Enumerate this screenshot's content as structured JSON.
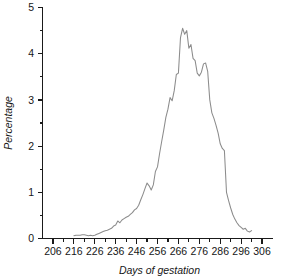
{
  "chart_data": {
    "type": "line",
    "title": "",
    "xlabel": "Days of gestation",
    "ylabel": "Percentage",
    "xlim": [
      201,
      311
    ],
    "ylim": [
      0,
      5
    ],
    "grid": false,
    "legend": "none",
    "line_color": "#8c8c8c",
    "axis_color": "#1a1a1a",
    "xticks": [
      206,
      216,
      226,
      236,
      246,
      256,
      266,
      276,
      286,
      296,
      306
    ],
    "xtick_labels": [
      "206",
      "216",
      "226",
      "236",
      "246",
      "256",
      "266",
      "276",
      "286",
      "296",
      "306"
    ],
    "xtick_minor_step": 5,
    "yticks": [
      0,
      1,
      2,
      3,
      4,
      5
    ],
    "ytick_labels": [
      "0",
      "1",
      "2",
      "3",
      "4",
      "5"
    ],
    "ytick_minor": [
      0.5,
      1.5,
      2.5,
      3.5,
      4.5
    ],
    "x": [
      216,
      217,
      218,
      219,
      220,
      221,
      222,
      223,
      224,
      225,
      226,
      227,
      228,
      229,
      230,
      231,
      232,
      233,
      234,
      235,
      236,
      237,
      238,
      239,
      240,
      241,
      242,
      243,
      244,
      245,
      246,
      247,
      248,
      249,
      250,
      251,
      252,
      253,
      254,
      255,
      256,
      257,
      258,
      259,
      260,
      261,
      262,
      263,
      264,
      265,
      266,
      267,
      268,
      269,
      270,
      271,
      272,
      273,
      274,
      275,
      276,
      277,
      278,
      279,
      280,
      281,
      282,
      283,
      284,
      285,
      286,
      287,
      288,
      289,
      290,
      291,
      292,
      293,
      294,
      295,
      296,
      297,
      298,
      299,
      300,
      301
    ],
    "y": [
      0.06,
      0.07,
      0.07,
      0.07,
      0.08,
      0.08,
      0.07,
      0.06,
      0.07,
      0.06,
      0.07,
      0.09,
      0.11,
      0.13,
      0.15,
      0.17,
      0.18,
      0.2,
      0.22,
      0.27,
      0.29,
      0.38,
      0.34,
      0.4,
      0.43,
      0.46,
      0.48,
      0.52,
      0.56,
      0.62,
      0.65,
      0.72,
      0.84,
      0.95,
      1.08,
      1.2,
      1.14,
      1.05,
      1.16,
      1.45,
      1.55,
      1.84,
      2.1,
      2.35,
      2.62,
      2.8,
      3.05,
      2.98,
      3.2,
      3.55,
      3.58,
      4.35,
      4.55,
      4.42,
      4.5,
      4.12,
      4.2,
      3.9,
      3.85,
      3.58,
      3.52,
      3.6,
      3.78,
      3.8,
      3.62,
      3.0,
      2.72,
      2.6,
      2.45,
      2.28,
      2.05,
      1.95,
      1.9,
      1.0,
      0.82,
      0.66,
      0.52,
      0.42,
      0.34,
      0.28,
      0.24,
      0.2,
      0.22,
      0.16,
      0.14,
      0.17,
      0.15,
      0.12,
      0.1,
      0.1,
      0.1,
      0.1,
      0.1,
      0.1,
      0.1,
      0.1,
      0.1,
      0.1,
      0.1,
      0.1
    ]
  }
}
